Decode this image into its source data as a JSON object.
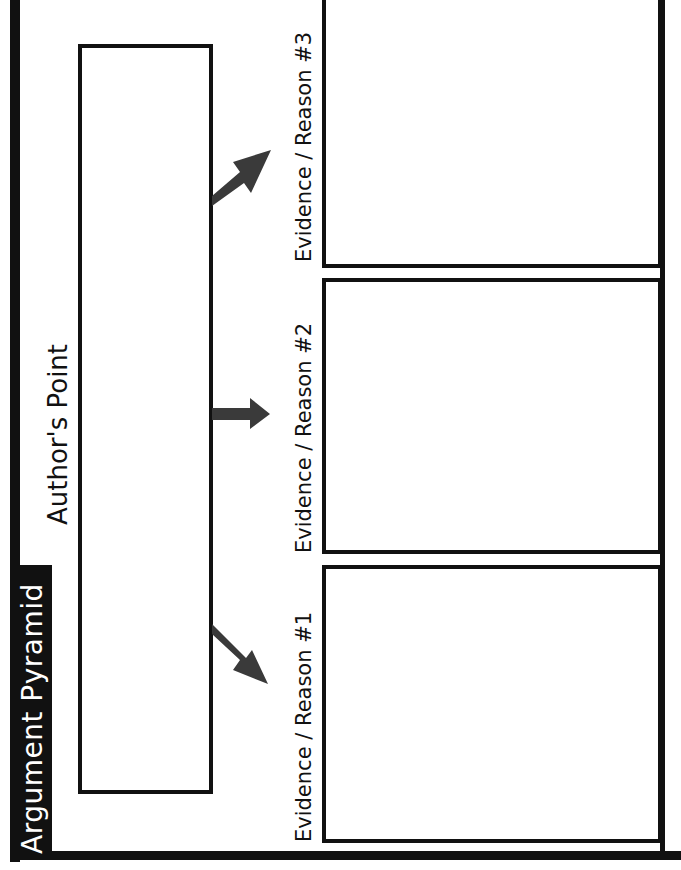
{
  "worksheet": {
    "title": "Argument Pyramid",
    "author_point": {
      "label": "Author's Point"
    },
    "evidence": [
      {
        "label": "Evidence / Reason #1"
      },
      {
        "label": "Evidence / Reason #2"
      },
      {
        "label": "Evidence / Reason #3"
      }
    ],
    "colors": {
      "ink": "#111111",
      "arrow": "#3a3a3a",
      "background": "#ffffff",
      "title_text": "#ffffff"
    },
    "icons": {
      "arrow_up_right": "arrow-up-right-icon",
      "arrow_right": "arrow-right-icon",
      "arrow_down_right": "arrow-down-right-icon"
    }
  }
}
